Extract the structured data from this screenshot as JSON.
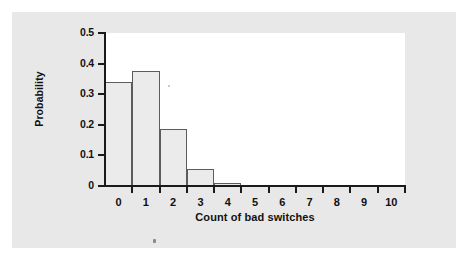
{
  "figure": {
    "background_color": "#e8e8e8",
    "plot_background_color": "#ffffff",
    "axis_color": "#1a1a1a",
    "bar_fill_color": "#ebebeb",
    "bar_edge_color": "#5c5c5c"
  },
  "chart_data": {
    "type": "bar",
    "title": "",
    "xlabel": "Count of bad switches",
    "ylabel": "Probability",
    "categories": [
      "0",
      "1",
      "2",
      "3",
      "4",
      "5",
      "6",
      "7",
      "8",
      "9",
      "10"
    ],
    "values": [
      0.34,
      0.375,
      0.185,
      0.055,
      0.01,
      0,
      0,
      0,
      0,
      0,
      0
    ],
    "x_tick_labels": [
      "0",
      "1",
      "2",
      "3",
      "4",
      "5",
      "6",
      "7",
      "8",
      "9",
      "10"
    ],
    "y_tick_labels": [
      "0",
      "0.1",
      "0.2",
      "0.3",
      "0.4",
      "0.5"
    ],
    "y_tick_values": [
      0,
      0.1,
      0.2,
      0.3,
      0.4,
      0.5
    ],
    "xlim": [
      -0.5,
      10.5
    ],
    "ylim": [
      0,
      0.5
    ],
    "grid": false,
    "legend": null
  }
}
